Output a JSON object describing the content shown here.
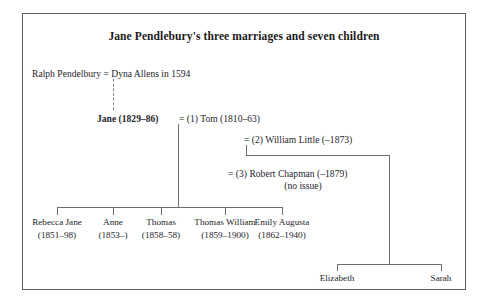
{
  "figure": {
    "title": "Jane Pendlebury's three marriages and seven children"
  },
  "generation1": {
    "father": "Ralph Pendelbury",
    "marriage_symbol": "=",
    "mother": "Dyna Allens in 1594",
    "full_line": "Ralph Pendelbury = Dyna Allens in 1594"
  },
  "generation2": {
    "subject": "Jane (1829–86)",
    "marriages": [
      {
        "symbol": "=",
        "ordinal": "(1)",
        "spouse": "Tom (1810–63)",
        "text": "= (1) Tom (1810–63)"
      },
      {
        "symbol": "=",
        "ordinal": "(2)",
        "spouse": "William Little (–1873)",
        "text": "= (2) William Little (–1873)"
      },
      {
        "symbol": "=",
        "ordinal": "(3)",
        "spouse": "Robert Chapman (–1879)",
        "text": "= (3) Robert Chapman (–1879)",
        "note": "(no issue)"
      }
    ]
  },
  "children_marriage1": [
    {
      "name": "Rebecca Jane",
      "dates": "(1851–98)"
    },
    {
      "name": "Anne",
      "dates": "(1853–)"
    },
    {
      "name": "Thomas",
      "dates": "(1858–58)"
    },
    {
      "name": "Thomas William",
      "dates": "(1859–1900)"
    },
    {
      "name": "Emily Augusta",
      "dates": "(1862–1940)"
    }
  ],
  "children_marriage2": [
    {
      "name": "Elizabeth"
    },
    {
      "name": "Sarah"
    }
  ],
  "colors": {
    "frame": "#5b5b63",
    "rule": "#6d6d75",
    "text": "#26262b",
    "background": "#ffffff"
  }
}
